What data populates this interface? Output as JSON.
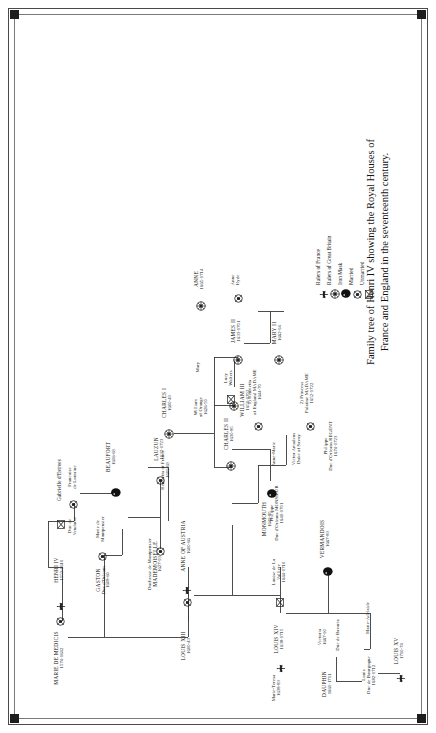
{
  "figure": {
    "caption_line1": "Family tree of Henri IV showing the Royal Houses of",
    "caption_line2": "France and England in the seventeenth century."
  },
  "legend": {
    "items": [
      {
        "icon": "fleur-de-lys",
        "label": "Rulers of France"
      },
      {
        "icon": "crown-gb",
        "label": "Rulers of Great Britain"
      },
      {
        "icon": "iron-mask",
        "label": "Iron Mask"
      },
      {
        "icon": "married",
        "label": "Married"
      },
      {
        "icon": "unmarried",
        "label": "Unmarried"
      }
    ]
  },
  "tree": {
    "nodes": [
      {
        "id": "marie",
        "name": "MARIE DE MEDICIS",
        "dates": "1574-1642",
        "marker": "married",
        "style": "caps"
      },
      {
        "id": "henri4",
        "name": "HENRI IV",
        "dates": "1553-1610",
        "marker": "fleur",
        "style": "caps"
      },
      {
        "id": "gabrielle",
        "name": "Gabrielle d'Estrees",
        "dates": "",
        "marker": "unmarried",
        "style": "roman"
      },
      {
        "id": "louis13",
        "name": "LOUIS XIII",
        "dates": "1600-43",
        "marker": "fleur",
        "style": "caps"
      },
      {
        "id": "anneaustria",
        "name": "ANNE OF AUSTRIA",
        "dates": "1600-66",
        "marker": "married",
        "style": "caps"
      },
      {
        "id": "henrietta",
        "name": "Henrietta of France",
        "dates": "1609-69",
        "marker": "none",
        "style": "roman"
      },
      {
        "id": "gaston",
        "name": "GASTON",
        "dates": "1608-60",
        "marker": "married",
        "style": "caps",
        "sub": "Duc d'Orleans"
      },
      {
        "id": "mariemontp",
        "name": "Marie de",
        "dates": "",
        "marker": "none",
        "style": "roman",
        "sub": "Montpensier"
      },
      {
        "id": "vendome",
        "name": "Duc de",
        "dates": "",
        "marker": "married",
        "style": "roman",
        "sub": "Vendome"
      },
      {
        "id": "francoise",
        "name": "Francoise",
        "dates": "",
        "marker": "none",
        "style": "roman",
        "sub": "de Lorraine"
      },
      {
        "id": "beaufort",
        "name": "BEAUFORT",
        "dates": "1616-69",
        "marker": "ironmask",
        "style": "caps"
      },
      {
        "id": "louis14",
        "name": "LOUIS XIV",
        "dates": "1638-1715",
        "marker": "fleur",
        "style": "caps"
      },
      {
        "id": "lavalliere",
        "name": "Louise de La",
        "dates": "1644-1710",
        "marker": "unmarried",
        "style": "roman",
        "sub": "Valliere"
      },
      {
        "id": "philippe",
        "name": "Philippe",
        "dates": "1640-1701",
        "marker": "none",
        "style": "roman",
        "sub": "Duc d'Orleans MONSIEUR"
      },
      {
        "id": "annemarie",
        "name": "Anne-Marie",
        "dates": "",
        "marker": "none",
        "style": "roman"
      },
      {
        "id": "victoramadeus",
        "name": "Victor Amadeus",
        "dates": "",
        "marker": "none",
        "style": "roman",
        "sub": "Duke of Savoy"
      },
      {
        "id": "henriettaeng",
        "name": "1) Henrietta",
        "dates": "1644-70",
        "marker": "married",
        "style": "roman",
        "sub": "of England MADAME"
      },
      {
        "id": "palatine",
        "name": "2) Princess",
        "dates": "1652-1722",
        "marker": "married",
        "style": "roman",
        "sub": "Palatine MADAME"
      },
      {
        "id": "regent",
        "name": "Philippe",
        "dates": "1674-1723",
        "marker": "none",
        "style": "roman",
        "sub": "Duc d'Orleans REGENT"
      },
      {
        "id": "charles1",
        "name": "CHARLES I",
        "dates": "1600-49",
        "marker": "crown",
        "style": "caps"
      },
      {
        "id": "charles2",
        "name": "CHARLES II",
        "dates": "1630-85",
        "marker": "crown",
        "style": "caps"
      },
      {
        "id": "lucywalters",
        "name": "Lucy",
        "dates": "",
        "marker": "unmarried",
        "style": "roman",
        "sub": "Walters"
      },
      {
        "id": "monmouth",
        "name": "MONMOUTH",
        "dates": "1649-85",
        "marker": "ironmask",
        "style": "caps"
      },
      {
        "id": "william3",
        "name": "WILLIAM III",
        "dates": "1650-1702",
        "marker": "crown",
        "style": "caps"
      },
      {
        "id": "williamorange",
        "name": "William",
        "dates": "1626-50",
        "marker": "none",
        "style": "roman",
        "sub": "of Orange"
      },
      {
        "id": "maryprincess",
        "name": "Mary",
        "dates": "",
        "marker": "none",
        "style": "roman"
      },
      {
        "id": "james2",
        "name": "JAMES II",
        "dates": "1633-1701",
        "marker": "crown",
        "style": "caps"
      },
      {
        "id": "annehyde",
        "name": "Anne",
        "dates": "",
        "marker": "married",
        "style": "roman",
        "sub": "Hyde"
      },
      {
        "id": "mary2",
        "name": "MARY II",
        "dates": "1662-94",
        "marker": "crown",
        "style": "caps"
      },
      {
        "id": "anne",
        "name": "ANNE",
        "dates": "1665-1714",
        "marker": "crown",
        "style": "caps"
      },
      {
        "id": "mademoiselle",
        "name": "MADEMOISELLE",
        "dates": "1627-93",
        "marker": "married",
        "style": "caps",
        "sub": "Duchesse de Montpensier"
      },
      {
        "id": "lauzun",
        "name": "LAUZUN",
        "dates": "1632-1723",
        "marker": "married",
        "style": "caps"
      },
      {
        "id": "marietheresa",
        "name": "Marie-Teresa",
        "dates": "1638-83",
        "marker": "none",
        "style": "roman"
      },
      {
        "id": "dauphin",
        "name": "DAUPHIN",
        "dates": "1661-1711",
        "marker": "none",
        "style": "caps"
      },
      {
        "id": "victoria",
        "name": "Victoria",
        "dates": "1667-90",
        "marker": "none",
        "style": "roman"
      },
      {
        "id": "bavaria",
        "name": "Duc de Bavaria",
        "dates": "",
        "marker": "none",
        "style": "roman"
      },
      {
        "id": "vermandois",
        "name": "VERMANDOIS",
        "dates": "1667-83",
        "marker": "ironmask",
        "style": "caps"
      },
      {
        "id": "louis_bourg",
        "name": "Louis",
        "dates": "1682-1712",
        "marker": "none",
        "style": "roman",
        "sub": "Duc de Bourgogne"
      },
      {
        "id": "marieadelaide",
        "name": "Marie-Adelaide",
        "dates": "",
        "marker": "none",
        "style": "roman"
      },
      {
        "id": "louis15",
        "name": "LOUIS XV",
        "dates": "1710-74",
        "marker": "fleur",
        "style": "caps"
      }
    ]
  }
}
